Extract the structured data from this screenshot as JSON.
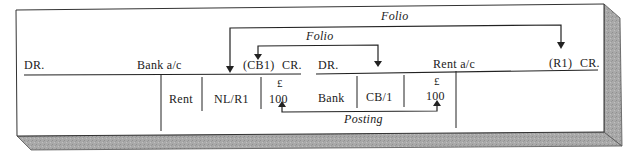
{
  "diagram": {
    "type": "double-entry ledger posting illustration",
    "labels": {
      "folio_outer": "Folio",
      "folio_inner": "Folio",
      "posting": "Posting"
    },
    "bank_account": {
      "dr_label": "DR.",
      "title": "Bank a/c",
      "folio_ref": "(CB1)",
      "cr_label": "CR.",
      "credit_entry": {
        "details": "Rent",
        "folio": "NL/R1",
        "currency": "£",
        "amount": "100"
      }
    },
    "rent_account": {
      "dr_label": "DR.",
      "title": "Rent a/c",
      "folio_ref": "(R1)",
      "cr_label": "CR.",
      "debit_entry": {
        "details": "Bank",
        "folio": "CB/1",
        "currency": "£",
        "amount": "100"
      }
    },
    "arrows": [
      {
        "label": "Folio",
        "from": "Rent a/c (R1)",
        "to": "Bank a/c folio column NL/R1"
      },
      {
        "label": "Folio",
        "from": "Rent a/c folio column CB/1",
        "to": "Bank a/c (CB1)"
      },
      {
        "label": "Posting",
        "from": "Bank a/c credit 100",
        "to": "Rent a/c debit 100"
      }
    ],
    "colors": {
      "ink": "#1a1a1a",
      "paper": "#ffffff",
      "shadow": "#a8a8a8"
    }
  }
}
